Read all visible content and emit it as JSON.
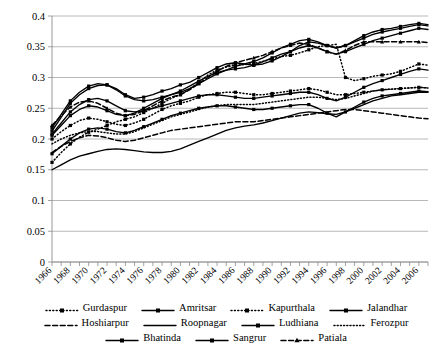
{
  "chart_data": {
    "type": "line",
    "title": "",
    "xlabel": "",
    "ylabel": "",
    "ylim": [
      0,
      0.4
    ],
    "ytick_labels": [
      "0",
      "0.05",
      "0.1",
      "0.15",
      "0.2",
      "0.25",
      "0.3",
      "0.35",
      "0.4"
    ],
    "ytick_values": [
      0,
      0.05,
      0.1,
      0.15,
      0.2,
      0.25,
      0.3,
      0.35,
      0.4
    ],
    "grid": true,
    "legend_position": "bottom",
    "x": [
      1966,
      1967,
      1968,
      1969,
      1970,
      1971,
      1972,
      1973,
      1974,
      1975,
      1976,
      1977,
      1978,
      1979,
      1980,
      1981,
      1982,
      1983,
      1984,
      1985,
      1986,
      1987,
      1988,
      1989,
      1990,
      1991,
      1992,
      1993,
      1994,
      1995,
      1996,
      1997,
      1998,
      1999,
      2000,
      2001,
      2002,
      2003,
      2004,
      2005,
      2006,
      2007
    ],
    "xtick_labels": [
      "1966",
      "1968",
      "1970",
      "1972",
      "1974",
      "1976",
      "1978",
      "1980",
      "1982",
      "1984",
      "1986",
      "1988",
      "1990",
      "1992",
      "1994",
      "1996",
      "1998",
      "2000",
      "2002",
      "2004",
      "2006"
    ],
    "series": [
      {
        "name": "Gurdaspur",
        "style": "dotted-marker",
        "values": [
          0.162,
          0.178,
          0.192,
          0.203,
          0.211,
          0.216,
          0.222,
          0.228,
          0.232,
          0.236,
          0.243,
          0.25,
          0.258,
          0.266,
          0.272,
          0.281,
          0.292,
          0.304,
          0.312,
          0.317,
          0.32,
          0.321,
          0.323,
          0.326,
          0.33,
          0.334,
          0.336,
          0.34,
          0.345,
          0.35,
          0.352,
          0.354,
          0.3,
          0.295,
          0.298,
          0.302,
          0.304,
          0.306,
          0.31,
          0.316,
          0.322,
          0.32
        ]
      },
      {
        "name": "Amritsar",
        "style": "solid-marker",
        "values": [
          0.213,
          0.235,
          0.258,
          0.272,
          0.282,
          0.287,
          0.288,
          0.282,
          0.272,
          0.266,
          0.268,
          0.272,
          0.278,
          0.282,
          0.288,
          0.292,
          0.3,
          0.308,
          0.316,
          0.322,
          0.324,
          0.322,
          0.32,
          0.322,
          0.327,
          0.334,
          0.342,
          0.352,
          0.358,
          0.356,
          0.352,
          0.348,
          0.352,
          0.36,
          0.368,
          0.374,
          0.378,
          0.38,
          0.383,
          0.386,
          0.388,
          0.386
        ]
      },
      {
        "name": "Kapurthala",
        "style": "dotted-marker",
        "values": [
          0.2,
          0.212,
          0.222,
          0.23,
          0.234,
          0.232,
          0.228,
          0.224,
          0.222,
          0.226,
          0.232,
          0.24,
          0.248,
          0.254,
          0.258,
          0.262,
          0.268,
          0.272,
          0.274,
          0.276,
          0.276,
          0.274,
          0.272,
          0.272,
          0.274,
          0.276,
          0.278,
          0.28,
          0.282,
          0.28,
          0.276,
          0.272,
          0.272,
          0.274,
          0.276,
          0.278,
          0.28,
          0.281,
          0.282,
          0.283,
          0.284,
          0.283
        ]
      },
      {
        "name": "Jalandhar",
        "style": "solid-marker",
        "values": [
          0.206,
          0.222,
          0.238,
          0.248,
          0.254,
          0.252,
          0.246,
          0.24,
          0.238,
          0.242,
          0.25,
          0.258,
          0.266,
          0.272,
          0.278,
          0.286,
          0.294,
          0.302,
          0.308,
          0.312,
          0.314,
          0.316,
          0.32,
          0.326,
          0.332,
          0.338,
          0.342,
          0.348,
          0.352,
          0.348,
          0.342,
          0.338,
          0.342,
          0.348,
          0.354,
          0.36,
          0.364,
          0.368,
          0.372,
          0.376,
          0.38,
          0.378
        ]
      },
      {
        "name": "Hoshiarpur",
        "style": "dashed",
        "values": [
          0.178,
          0.188,
          0.196,
          0.202,
          0.206,
          0.205,
          0.202,
          0.198,
          0.196,
          0.198,
          0.202,
          0.206,
          0.21,
          0.214,
          0.216,
          0.218,
          0.22,
          0.222,
          0.224,
          0.226,
          0.228,
          0.228,
          0.228,
          0.23,
          0.232,
          0.234,
          0.236,
          0.238,
          0.24,
          0.242,
          0.244,
          0.246,
          0.248,
          0.248,
          0.246,
          0.244,
          0.242,
          0.24,
          0.238,
          0.236,
          0.234,
          0.233
        ]
      },
      {
        "name": "Roopnagar",
        "style": "solid-plain",
        "values": [
          0.15,
          0.158,
          0.166,
          0.172,
          0.176,
          0.18,
          0.183,
          0.184,
          0.183,
          0.181,
          0.179,
          0.178,
          0.178,
          0.18,
          0.184,
          0.19,
          0.196,
          0.202,
          0.208,
          0.214,
          0.218,
          0.221,
          0.223,
          0.226,
          0.23,
          0.234,
          0.238,
          0.242,
          0.244,
          0.243,
          0.241,
          0.24,
          0.244,
          0.25,
          0.256,
          0.262,
          0.266,
          0.27,
          0.272,
          0.274,
          0.276,
          0.276
        ]
      },
      {
        "name": "Ludhiana",
        "style": "solid-marker",
        "values": [
          0.218,
          0.24,
          0.262,
          0.276,
          0.286,
          0.29,
          0.288,
          0.28,
          0.27,
          0.264,
          0.262,
          0.264,
          0.268,
          0.272,
          0.276,
          0.282,
          0.29,
          0.298,
          0.306,
          0.312,
          0.318,
          0.322,
          0.326,
          0.332,
          0.34,
          0.348,
          0.354,
          0.36,
          0.362,
          0.358,
          0.352,
          0.348,
          0.352,
          0.358,
          0.364,
          0.37,
          0.374,
          0.377,
          0.38,
          0.383,
          0.386,
          0.384
        ]
      },
      {
        "name": "Ferozpur",
        "style": "dotted-plain",
        "values": [
          0.192,
          0.2,
          0.206,
          0.21,
          0.212,
          0.212,
          0.21,
          0.208,
          0.208,
          0.212,
          0.218,
          0.224,
          0.23,
          0.236,
          0.24,
          0.244,
          0.248,
          0.252,
          0.254,
          0.256,
          0.256,
          0.256,
          0.256,
          0.258,
          0.26,
          0.262,
          0.264,
          0.266,
          0.268,
          0.268,
          0.266,
          0.264,
          0.266,
          0.27,
          0.274,
          0.278,
          0.28,
          0.281,
          0.282,
          0.283,
          0.284,
          0.283
        ]
      },
      {
        "name": "Bhatinda",
        "style": "solid-marker",
        "values": [
          0.176,
          0.188,
          0.2,
          0.21,
          0.216,
          0.218,
          0.216,
          0.212,
          0.21,
          0.214,
          0.22,
          0.226,
          0.232,
          0.238,
          0.242,
          0.246,
          0.25,
          0.252,
          0.254,
          0.254,
          0.252,
          0.25,
          0.248,
          0.248,
          0.25,
          0.252,
          0.254,
          0.256,
          0.256,
          0.25,
          0.242,
          0.236,
          0.244,
          0.252,
          0.26,
          0.266,
          0.27,
          0.272,
          0.274,
          0.276,
          0.278,
          0.277
        ]
      },
      {
        "name": "Sangrur",
        "style": "solid-marker",
        "values": [
          0.208,
          0.226,
          0.244,
          0.256,
          0.264,
          0.266,
          0.262,
          0.254,
          0.246,
          0.244,
          0.246,
          0.25,
          0.254,
          0.258,
          0.262,
          0.266,
          0.27,
          0.272,
          0.272,
          0.27,
          0.268,
          0.266,
          0.266,
          0.268,
          0.27,
          0.272,
          0.274,
          0.276,
          0.276,
          0.272,
          0.266,
          0.262,
          0.268,
          0.276,
          0.284,
          0.29,
          0.295,
          0.3,
          0.305,
          0.31,
          0.314,
          0.312
        ]
      },
      {
        "name": "Patiala",
        "style": "dashed-marker",
        "values": [
          0.222,
          0.238,
          0.252,
          0.26,
          0.262,
          0.258,
          0.25,
          0.242,
          0.238,
          0.24,
          0.246,
          0.254,
          0.262,
          0.268,
          0.272,
          0.28,
          0.29,
          0.3,
          0.31,
          0.318,
          0.324,
          0.328,
          0.332,
          0.336,
          0.342,
          0.348,
          0.352,
          0.356,
          0.354,
          0.348,
          0.342,
          0.338,
          0.344,
          0.352,
          0.358,
          0.358,
          0.358,
          0.358,
          0.358,
          0.358,
          0.358,
          0.357
        ]
      }
    ]
  },
  "legend": {
    "rows": [
      [
        {
          "label": "Gurdaspur",
          "style": "dotted-marker"
        },
        {
          "label": "Amritsar",
          "style": "solid-marker"
        },
        {
          "label": "Kapurthala",
          "style": "dotted-marker"
        },
        {
          "label": "Jalandhar",
          "style": "solid-marker"
        }
      ],
      [
        {
          "label": "Hoshiarpur",
          "style": "dashed"
        },
        {
          "label": "Roopnagar",
          "style": "solid-plain"
        },
        {
          "label": "Ludhiana",
          "style": "solid-marker"
        },
        {
          "label": "Ferozpur",
          "style": "dotted-plain"
        }
      ],
      [
        {
          "label": "Bhatinda",
          "style": "solid-marker"
        },
        {
          "label": "Sangrur",
          "style": "solid-marker"
        },
        {
          "label": "Patiala",
          "style": "dashed-marker"
        }
      ]
    ]
  }
}
